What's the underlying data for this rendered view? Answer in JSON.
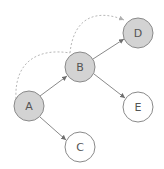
{
  "diagram": {
    "type": "directed-graph",
    "colors": {
      "filled_node": "#d3d3d3",
      "empty_node": "#ffffff",
      "stroke": "#8a8a8a",
      "edge": "#8a8a8a",
      "dashed_edge": "#b0b0b0",
      "label": "#555555"
    },
    "nodes": [
      {
        "id": "A",
        "label": "A",
        "x": 29,
        "y": 106,
        "r": 15,
        "filled": true
      },
      {
        "id": "B",
        "label": "B",
        "x": 80,
        "y": 67,
        "r": 15,
        "filled": true
      },
      {
        "id": "C",
        "label": "C",
        "x": 80,
        "y": 147,
        "r": 15,
        "filled": false
      },
      {
        "id": "D",
        "label": "D",
        "x": 138,
        "y": 33,
        "r": 15,
        "filled": true
      },
      {
        "id": "E",
        "label": "E",
        "x": 138,
        "y": 107,
        "r": 15,
        "filled": false
      }
    ],
    "edges": [
      {
        "from": "A",
        "to": "B",
        "style": "solid"
      },
      {
        "from": "A",
        "to": "C",
        "style": "solid"
      },
      {
        "from": "B",
        "to": "D",
        "style": "solid"
      },
      {
        "from": "B",
        "to": "E",
        "style": "solid"
      },
      {
        "from": "A",
        "to": "B",
        "style": "dashed",
        "curved": true
      },
      {
        "from": "B",
        "to": "D",
        "style": "dashed",
        "curved": true
      }
    ]
  }
}
